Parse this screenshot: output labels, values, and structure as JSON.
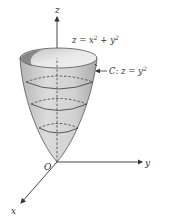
{
  "diagram": {
    "axes": {
      "z_label": "z",
      "y_label": "y",
      "x_label": "x",
      "origin_label": "O"
    },
    "surface": {
      "equation_main": "z = x",
      "equation_exp1": "2",
      "equation_plus": " + y",
      "equation_exp2": "2",
      "name": "paraboloid"
    },
    "curve": {
      "label_main": "C: z = y",
      "label_exp": "2"
    },
    "colors": {
      "surface_fill": "#c9c9c9",
      "surface_light": "#e6e6e6",
      "lines": "#4a4a4a",
      "axis": "#333333"
    }
  }
}
